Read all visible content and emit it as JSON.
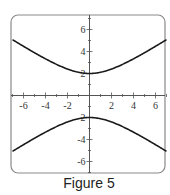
{
  "caption": "Figure 5",
  "colors": {
    "frame": "#8a8a8a",
    "axis": "#555555",
    "curve": "#1a1a1a",
    "text": "#333333"
  },
  "chart_data": {
    "type": "line",
    "title": "",
    "caption": "Figure 5",
    "xlabel": "",
    "ylabel": "",
    "xlim": [
      -7,
      7
    ],
    "ylim": [
      -7,
      7
    ],
    "grid": false,
    "legend": null,
    "x_tick_labels": [
      "-6",
      "-4",
      "-2",
      "2",
      "4",
      "6"
    ],
    "x_ticks": [
      -6,
      -4,
      -2,
      2,
      4,
      6
    ],
    "y_tick_labels": [
      "6",
      "4",
      "2",
      "-2",
      "-4",
      "-6"
    ],
    "y_ticks": [
      6,
      4,
      2,
      -2,
      -4,
      -6
    ],
    "equation": "y^2/4 - x^2/9 = 1",
    "series": [
      {
        "name": "upper branch",
        "x": [
          -7,
          -6,
          -5,
          -4,
          -3,
          -2,
          -1,
          0,
          1,
          2,
          3,
          4,
          5,
          6,
          7
        ],
        "y": [
          5.08,
          4.47,
          3.89,
          3.33,
          2.83,
          2.4,
          2.11,
          2.0,
          2.11,
          2.4,
          2.83,
          3.33,
          3.89,
          4.47,
          5.08
        ]
      },
      {
        "name": "lower branch",
        "x": [
          -7,
          -6,
          -5,
          -4,
          -3,
          -2,
          -1,
          0,
          1,
          2,
          3,
          4,
          5,
          6,
          7
        ],
        "y": [
          -5.08,
          -4.47,
          -3.89,
          -3.33,
          -2.83,
          -2.4,
          -2.11,
          -2.0,
          -2.11,
          -2.4,
          -2.83,
          -3.33,
          -3.89,
          -4.47,
          -5.08
        ]
      }
    ]
  }
}
